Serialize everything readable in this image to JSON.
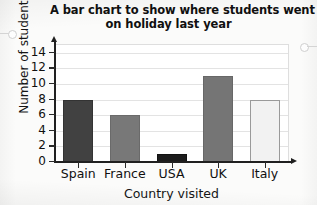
{
  "chart_data": {
    "type": "bar",
    "title": "A bar chart to show where students went on holiday last year",
    "title_lines": [
      "A bar chart to show where students went",
      "on holiday last year"
    ],
    "xlabel": "Country visited",
    "ylabel": "Number of students",
    "categories": [
      "Spain",
      "France",
      "USA",
      "UK",
      "Italy"
    ],
    "values": [
      8,
      6,
      1,
      11,
      8
    ],
    "ylim": [
      0,
      15
    ],
    "ytick_labels": [
      "0",
      "2",
      "4",
      "6",
      "8",
      "10",
      "12",
      "14"
    ],
    "ytick_values": [
      0,
      2,
      4,
      6,
      8,
      10,
      12,
      14
    ],
    "grid": true,
    "legend": null,
    "bar_colors": [
      "#414141",
      "#787878",
      "#1c1c1c",
      "#757575",
      "#f2f2f2"
    ],
    "bar_border_colors": [
      "#333333",
      "#6a6a6a",
      "#121212",
      "#676767",
      "#9a9a9a"
    ],
    "bars": [
      {
        "category": "Spain",
        "value": 8,
        "color": "#414141",
        "border": "#333333"
      },
      {
        "category": "France",
        "value": 6,
        "color": "#787878",
        "border": "#6a6a6a"
      },
      {
        "category": "USA",
        "value": 1,
        "color": "#1c1c1c",
        "border": "#121212"
      },
      {
        "category": "UK",
        "value": 11,
        "color": "#757575",
        "border": "#676767"
      },
      {
        "category": "Italy",
        "value": 8,
        "color": "#f2f2f2",
        "border": "#9a9a9a"
      }
    ]
  },
  "page": {
    "background": "#fbfbfa",
    "axis_color": "#202020",
    "grid_color": "#e3e3e3",
    "text_color": "#101010"
  },
  "marks": {
    "ring_left_name": "binder-ring-mark-left",
    "ring_right_name": "binder-ring-mark-right"
  }
}
